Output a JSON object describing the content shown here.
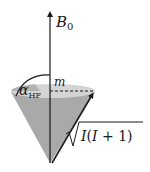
{
  "diagram": {
    "labels": {
      "field_symbol": "B",
      "field_subscript": "0",
      "projection": "m",
      "angle_symbol": "α",
      "angle_subscript": "HF",
      "magnitude_I1": "I",
      "magnitude_paren_open": "(",
      "magnitude_I2": "I",
      "magnitude_plus": " + 1)"
    },
    "colors": {
      "cone_body": "#a9a9a9",
      "cone_top": "#d4d4d4",
      "cone_top_rim": "#bdbdbd",
      "lines": "#1a1a1a",
      "background": "#ffffff"
    }
  }
}
